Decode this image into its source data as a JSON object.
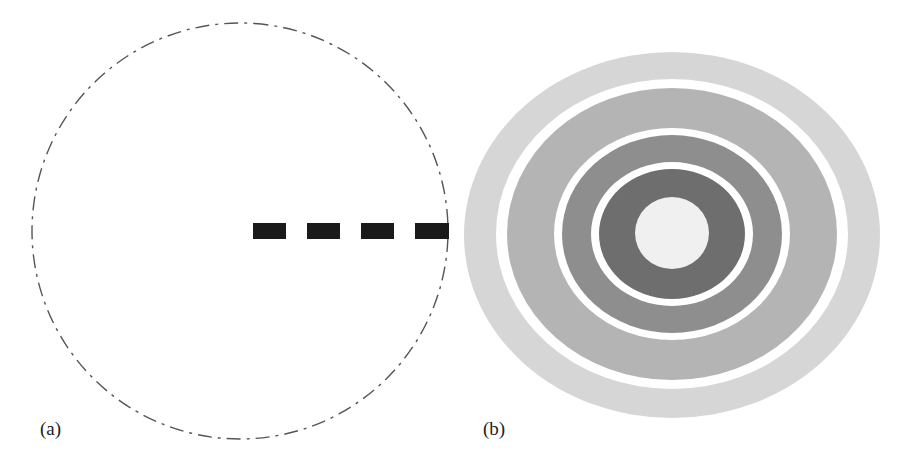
{
  "figure": {
    "panels": [
      {
        "id": "a",
        "label": "(a)",
        "description": "dashed circle with a thick dashed radius to the right edge",
        "circle": {
          "cx": 240,
          "cy": 231,
          "r": 208,
          "stroke": "#555555"
        },
        "radius_line": {
          "x1": 253,
          "x2": 449,
          "y": 231,
          "dash_count": 4,
          "color": "#1a1a1a"
        }
      },
      {
        "id": "b",
        "label": "(b)",
        "description": "concentric gray rings separated by white gaps, light center",
        "center": {
          "cx": 212,
          "cy": 232
        },
        "rings": [
          {
            "name": "ring-1-outer",
            "rx": 208,
            "ry": 182,
            "color": "#d6d6d6"
          },
          {
            "name": "gap-1",
            "rx": 177,
            "ry": 155,
            "color": "#ffffff"
          },
          {
            "name": "ring-2",
            "rx": 165,
            "ry": 146,
            "color": "#b4b4b4"
          },
          {
            "name": "gap-2",
            "rx": 118,
            "ry": 106,
            "color": "#ffffff"
          },
          {
            "name": "ring-3",
            "rx": 110,
            "ry": 99,
            "color": "#8e8e8e"
          },
          {
            "name": "gap-3",
            "rx": 80,
            "ry": 71,
            "color": "#ffffff"
          },
          {
            "name": "ring-4",
            "rx": 73,
            "ry": 65,
            "color": "#6e6e6e"
          },
          {
            "name": "center-disk",
            "rx": 36,
            "ry": 36,
            "color": "#f0f0f0"
          }
        ]
      }
    ]
  }
}
